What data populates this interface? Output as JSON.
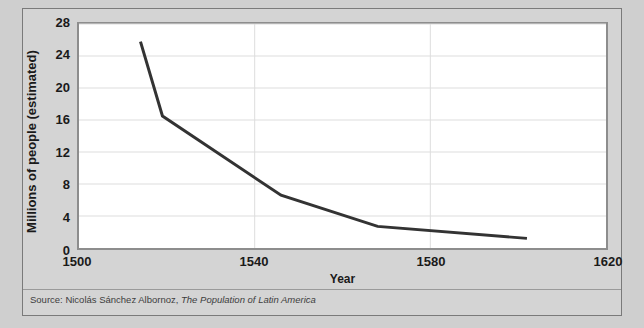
{
  "figure": {
    "background_color": "#cfcfcf",
    "panel_color": "#d4d4d4",
    "plot_color": "#ffffff",
    "border_color": "#7a7a7a",
    "line_color": "#333333"
  },
  "source": {
    "prefix": "Source: Nicolás Sánchez Albornoz, ",
    "work": "The Population of Latin America"
  },
  "chart_data": {
    "type": "line",
    "title": "",
    "xlabel": "Year",
    "ylabel": "Millions of people (estimated)",
    "xlim": [
      1500,
      1620
    ],
    "ylim": [
      0,
      28
    ],
    "xticks": [
      1500,
      1540,
      1580,
      1620
    ],
    "yticks": [
      0,
      4,
      8,
      12,
      16,
      20,
      24,
      28
    ],
    "xtick_labels": [
      "1500",
      "1540",
      "1580",
      "1620"
    ],
    "ytick_labels": [
      "0",
      "4",
      "8",
      "12",
      "16",
      "20",
      "24",
      "28"
    ],
    "grid": "horizontal-and-vertical",
    "legend": "none",
    "series": [
      {
        "name": "Estimated population of Latin America",
        "color": "#333333",
        "line_width": 3,
        "x": [
          1514,
          1519,
          1546,
          1568,
          1602
        ],
        "values": [
          25.8,
          16.5,
          6.6,
          2.7,
          1.2
        ]
      }
    ]
  }
}
